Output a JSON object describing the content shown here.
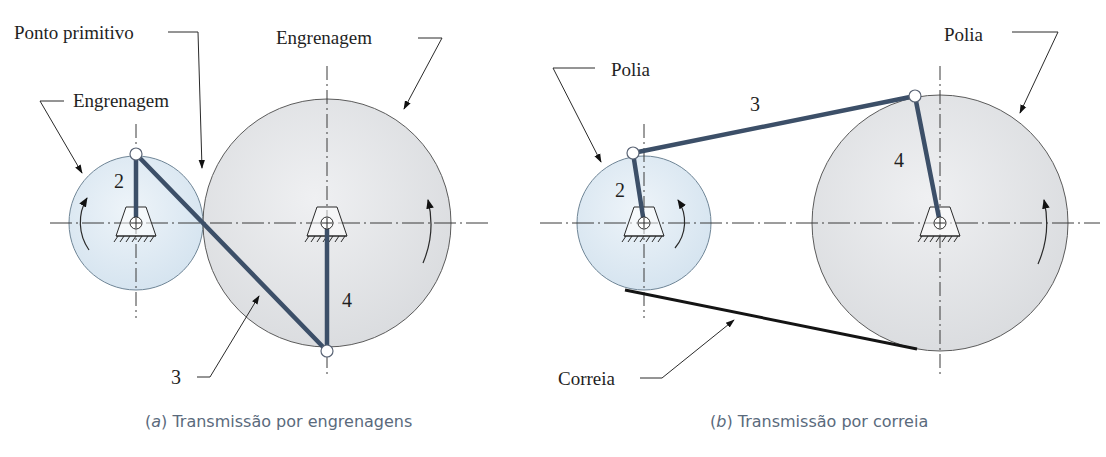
{
  "panels": {
    "a": {
      "caption_letter": "a",
      "caption_text": "Transmissão por engrenagens",
      "labels": {
        "ponto_primitivo": "Ponto primitivo",
        "engrenagem_small": "Engrenagem",
        "engrenagem_large": "Engrenagem",
        "link2": "2",
        "link3": "3",
        "link4": "4"
      }
    },
    "b": {
      "caption_letter": "b",
      "caption_text": "Transmissão por correia",
      "labels": {
        "polia_small": "Polia",
        "polia_large": "Polia",
        "correia": "Correia",
        "link2": "2",
        "link3": "3",
        "link4": "4"
      }
    }
  },
  "colors": {
    "small_wheel_fill": "#dde9f3",
    "large_wheel_fill": "#e2e4e7",
    "link": "#3c4f68",
    "belt": "#141414",
    "caption": "#5a6a7c"
  }
}
